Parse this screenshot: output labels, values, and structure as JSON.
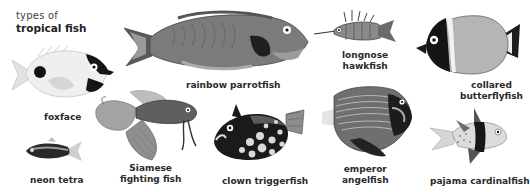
{
  "title": {
    "subtitle": "types of",
    "heading": "tropical fish"
  },
  "fish": [
    {
      "id": "foxface",
      "label_lines": [
        "foxface"
      ]
    },
    {
      "id": "rainbow-parrotfish",
      "label_lines": [
        "rainbow parrotfish"
      ]
    },
    {
      "id": "longnose-hawkfish",
      "label_lines": [
        "longnose",
        "hawkfish"
      ]
    },
    {
      "id": "collared-butterflyfish",
      "label_lines": [
        "collared",
        "butterflyfish"
      ]
    },
    {
      "id": "neon-tetra",
      "label_lines": [
        "neon tetra"
      ]
    },
    {
      "id": "siamese-fighting-fish",
      "label_lines": [
        "Siamese",
        "fighting fish"
      ]
    },
    {
      "id": "clown-triggerfish",
      "label_lines": [
        "clown triggerfish"
      ]
    },
    {
      "id": "emperor-angelfish",
      "label_lines": [
        "emperor",
        "angelfish"
      ]
    },
    {
      "id": "pajama-cardinalfish",
      "label_lines": [
        "pajama cardinalfish"
      ]
    }
  ],
  "colors": {
    "background": "#ffffff",
    "text": "#222222",
    "fish_dark": "#1a1a1a",
    "fish_mid": "#6e6e6e",
    "fish_light": "#d8d8d8"
  }
}
